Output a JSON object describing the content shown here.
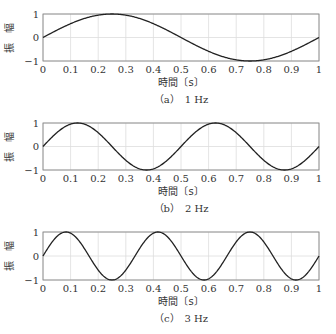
{
  "figure": {
    "panels": [
      {
        "caption": "（a）　1 Hz",
        "xlabel": "時間〔s〕",
        "ylabel": "振　幅"
      },
      {
        "caption": "（b）　2 Hz",
        "xlabel": "時間〔s〕",
        "ylabel": "振　幅"
      },
      {
        "caption": "（c）　3 Hz",
        "xlabel": "時間〔s〕",
        "ylabel": "振　幅"
      }
    ]
  },
  "chart_data": [
    {
      "type": "line",
      "title": "（a） 1 Hz",
      "xlabel": "時間〔s〕",
      "ylabel": "振 幅",
      "function": "sin(2*pi*1*t)",
      "frequency_hz": 1,
      "xlim": [
        0,
        1
      ],
      "ylim": [
        -1,
        1
      ],
      "xticks": [
        0,
        0.1,
        0.2,
        0.3,
        0.4,
        0.5,
        0.6,
        0.7,
        0.8,
        0.9,
        1
      ],
      "xtick_labels": [
        "0",
        "0.1",
        "0.2",
        "0.3",
        "0.4",
        "0.5",
        "0.6",
        "0.7",
        "0.8",
        "0.9",
        "1"
      ],
      "yticks": [
        -1,
        0,
        1
      ],
      "ytick_labels": [
        "−1",
        "0",
        "1"
      ],
      "grid": true,
      "x": [
        0,
        0.1,
        0.2,
        0.25,
        0.3,
        0.4,
        0.5,
        0.6,
        0.7,
        0.75,
        0.8,
        0.9,
        1
      ],
      "y": [
        0,
        0.588,
        0.951,
        1,
        0.951,
        0.588,
        0,
        -0.588,
        -0.951,
        -1,
        -0.951,
        -0.588,
        0
      ]
    },
    {
      "type": "line",
      "title": "（b） 2 Hz",
      "xlabel": "時間〔s〕",
      "ylabel": "振 幅",
      "function": "sin(2*pi*2*t)",
      "frequency_hz": 2,
      "xlim": [
        0,
        1
      ],
      "ylim": [
        -1,
        1
      ],
      "xticks": [
        0,
        0.1,
        0.2,
        0.3,
        0.4,
        0.5,
        0.6,
        0.7,
        0.8,
        0.9,
        1
      ],
      "xtick_labels": [
        "0",
        "0.1",
        "0.2",
        "0.3",
        "0.4",
        "0.5",
        "0.6",
        "0.7",
        "0.8",
        "0.9",
        "1"
      ],
      "yticks": [
        -1,
        0,
        1
      ],
      "ytick_labels": [
        "−1",
        "0",
        "1"
      ],
      "grid": true,
      "x": [
        0,
        0.125,
        0.25,
        0.375,
        0.5,
        0.625,
        0.75,
        0.875,
        1
      ],
      "y": [
        0,
        1,
        0,
        -1,
        0,
        1,
        0,
        -1,
        0
      ]
    },
    {
      "type": "line",
      "title": "（c） 3 Hz",
      "xlabel": "時間〔s〕",
      "ylabel": "振 幅",
      "function": "sin(2*pi*3*t)",
      "frequency_hz": 3,
      "xlim": [
        0,
        1
      ],
      "ylim": [
        -1,
        1
      ],
      "xticks": [
        0,
        0.1,
        0.2,
        0.3,
        0.4,
        0.5,
        0.6,
        0.7,
        0.8,
        0.9,
        1
      ],
      "xtick_labels": [
        "0",
        "0.1",
        "0.2",
        "0.3",
        "0.4",
        "0.5",
        "0.6",
        "0.7",
        "0.8",
        "0.9",
        "1"
      ],
      "yticks": [
        -1,
        0,
        1
      ],
      "ytick_labels": [
        "−1",
        "0",
        "1"
      ],
      "grid": true,
      "x": [
        0,
        0.0833,
        0.1667,
        0.25,
        0.3333,
        0.4167,
        0.5,
        0.5833,
        0.6667,
        0.75,
        0.8333,
        0.9167,
        1
      ],
      "y": [
        0,
        1,
        0,
        -1,
        0,
        1,
        0,
        -1,
        0,
        1,
        0,
        -1,
        0
      ]
    }
  ],
  "colors": {
    "line": "#222222",
    "grid": "#dddddd",
    "axes": "#888888"
  }
}
